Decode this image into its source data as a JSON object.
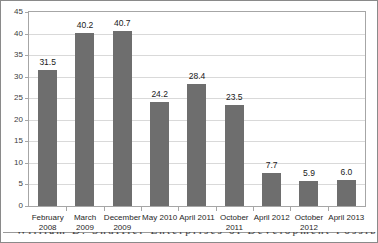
{
  "chart_data": {
    "type": "bar",
    "title": "",
    "subtitle": "",
    "xlabel": "",
    "ylabel": "",
    "ylim": [
      0,
      45
    ],
    "ytick_step": 5,
    "yticks": [
      45,
      40,
      35,
      30,
      25,
      20,
      15,
      10,
      5,
      0
    ],
    "grid": true,
    "legend": false,
    "legend_position": "none",
    "bar_color": "#6e6e6e",
    "gridline_color": "#d9d9d9",
    "axis_color": "#a6a6a6",
    "categories": [
      "February 2008",
      "March 2009",
      "December 2009",
      "May 2010",
      "April 2011",
      "October 2011",
      "April 2012",
      "October 2012",
      "April 2013"
    ],
    "category_lines": [
      [
        "February",
        "2008"
      ],
      [
        "March",
        "2009"
      ],
      [
        "December",
        "2009"
      ],
      [
        "May 2010",
        ""
      ],
      [
        "April 2011",
        ""
      ],
      [
        "October",
        "2011"
      ],
      [
        "April 2012",
        ""
      ],
      [
        "October",
        "2012"
      ],
      [
        "April 2013",
        ""
      ]
    ],
    "values": [
      31.5,
      40.2,
      40.7,
      24.2,
      28.4,
      23.5,
      7.7,
      5.9,
      6.0
    ],
    "value_labels": [
      "31.5",
      "40.2",
      "40.7",
      "24.2",
      "28.4",
      "23.5",
      "7.7",
      "5.9",
      "6.0"
    ]
  },
  "caption": {
    "cropped_line": "William D. Shuffler Enterprises of Development Possibilities Employment"
  }
}
